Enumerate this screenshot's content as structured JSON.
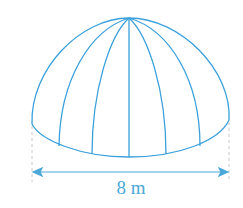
{
  "figure": {
    "shape": "hemispherical dome",
    "dimension_label": "8 m",
    "dimension_meaning": "diameter of base",
    "colors": {
      "stroke": "#3aa0dc",
      "label": "#4aa8d8",
      "dashed": "#c8c8c8"
    }
  }
}
